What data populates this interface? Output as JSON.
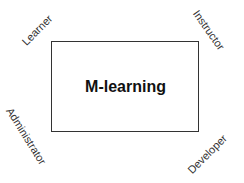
{
  "diagram": {
    "center": {
      "label": "M-learning"
    },
    "actors": [
      {
        "label": "Learner",
        "position": "top-left"
      },
      {
        "label": "Instructor",
        "position": "top-right"
      },
      {
        "label": "Administrator",
        "position": "bottom-left"
      },
      {
        "label": "Developer",
        "position": "bottom-right"
      }
    ]
  }
}
